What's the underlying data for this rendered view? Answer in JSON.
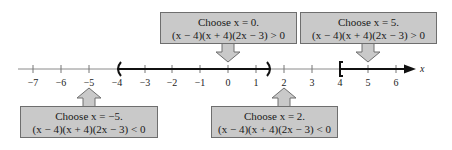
{
  "axis": {
    "variable": "x",
    "min": -7,
    "max": 6,
    "ticks": [
      "−7",
      "−6",
      "−5",
      "−4",
      "−3",
      "−2",
      "−1",
      "0",
      "1",
      "2",
      "3",
      "4",
      "5",
      "6"
    ]
  },
  "solution_intervals": [
    {
      "from": -4,
      "to": 1.5,
      "left_bracket": "(",
      "right_bracket": ")"
    },
    {
      "from": 4,
      "to": "infinity",
      "left_bracket": "[",
      "right_bracket": "arrow"
    }
  ],
  "test_points": [
    {
      "id": "test-x-neg5",
      "choose": "Choose x = −5.",
      "result": "(x − 4)(x + 4)(2x − 3) < 0",
      "position": "below"
    },
    {
      "id": "test-x-0",
      "choose": "Choose x = 0.",
      "result": "(x − 4)(x + 4)(2x − 3) > 0",
      "position": "above"
    },
    {
      "id": "test-x-2",
      "choose": "Choose x = 2.",
      "result": "(x − 4)(x + 4)(2x − 3) < 0",
      "position": "below"
    },
    {
      "id": "test-x-5",
      "choose": "Choose x = 5.",
      "result": "(x − 4)(x + 4)(2x − 3) > 0",
      "position": "above"
    }
  ],
  "colors": {
    "box_fill": "#c9c9c9",
    "box_border": "#6e6e6e",
    "axis": "#888888",
    "interval": "#111111"
  }
}
